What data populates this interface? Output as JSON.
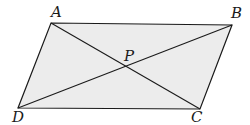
{
  "diagram": {
    "type": "geometry",
    "shape": "parallelogram",
    "fill_color": "#ececec",
    "stroke_color": "#1a1a1a",
    "vertices": {
      "A": {
        "x": 51,
        "y": 23
      },
      "B": {
        "x": 232,
        "y": 25
      },
      "C": {
        "x": 200,
        "y": 109
      },
      "D": {
        "x": 18,
        "y": 108
      }
    },
    "intersection": {
      "P": {
        "x": 125,
        "y": 67
      }
    },
    "segments": [
      "AB",
      "BC",
      "CD",
      "DA",
      "AC",
      "BD"
    ],
    "labels": {
      "A": "A",
      "B": "B",
      "C": "C",
      "D": "D",
      "P": "P"
    }
  }
}
